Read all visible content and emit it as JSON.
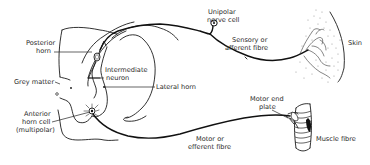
{
  "diagram": {
    "labels": {
      "posterior_horn": [
        "Posterior",
        "horn"
      ],
      "grey_matter": "Grey matter",
      "intermediate_neuron": [
        "Intermediate",
        "neuron"
      ],
      "lateral_horn": "Lateral horn",
      "anterior_horn_cell": [
        "Anterior",
        "horn cell",
        "(multipolar)"
      ],
      "unipolar_nerve_cell": [
        "Unipolar",
        "nerve cell"
      ],
      "sensory_fibre": [
        "Sensory or",
        "afferent fibre"
      ],
      "skin": "Skin",
      "motor_end_plate": [
        "Motor end",
        "plate"
      ],
      "motor_fibre": [
        "Motor or",
        "efferent fibre"
      ],
      "muscle_fibre": "Muscle fibre"
    },
    "colors": {
      "background": "#ffffff",
      "ink": "#1c1c1c",
      "stipple": "#9a9a9a"
    }
  }
}
